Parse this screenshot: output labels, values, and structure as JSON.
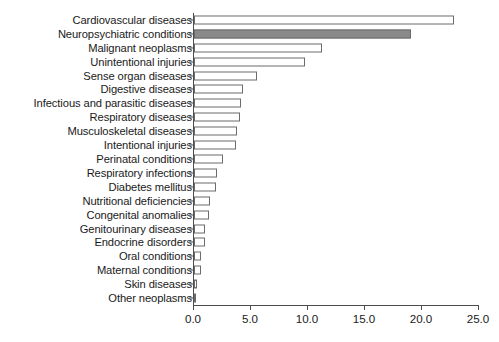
{
  "chart_data": {
    "type": "bar",
    "orientation": "horizontal",
    "title": "",
    "subtitle": "",
    "xlabel": "",
    "ylabel": "",
    "xlim": [
      0.0,
      25.0
    ],
    "xticks": [
      "0.0",
      "5.0",
      "10.0",
      "15.0",
      "20.0",
      "25.0"
    ],
    "xtick_values": [
      0.0,
      5.0,
      10.0,
      15.0,
      20.0,
      25.0
    ],
    "grid": false,
    "legend": false,
    "categories": [
      "Cardiovascular diseases",
      "Neuropsychiatric conditions",
      "Malignant neoplasms",
      "Unintentional injuries",
      "Sense organ diseases",
      "Digestive diseases",
      "Infectious and parasitic diseases",
      "Respiratory diseases",
      "Musculoskeletal diseases",
      "Intentional injuries",
      "Perinatal conditions",
      "Respiratory infections",
      "Diabetes mellitus",
      "Nutritional deficiencies",
      "Congenital anomalies",
      "Genitourinary diseases",
      "Endocrine disorders",
      "Oral conditions",
      "Maternal conditions",
      "Skin diseases",
      "Other neoplasms"
    ],
    "values": [
      22.8,
      19.0,
      11.2,
      9.7,
      5.5,
      4.3,
      4.1,
      4.0,
      3.8,
      3.7,
      2.5,
      2.0,
      1.9,
      1.4,
      1.3,
      1.0,
      1.0,
      0.6,
      0.6,
      0.25,
      0.2
    ],
    "highlight_index": 1,
    "colors": {
      "bar_fill": "#ffffff",
      "bar_edge": "#6b6b6b",
      "highlight_fill": "#8a8a8a",
      "axis": "#4d4d4d",
      "text": "#1a1a1a",
      "background": "#ffffff"
    }
  }
}
